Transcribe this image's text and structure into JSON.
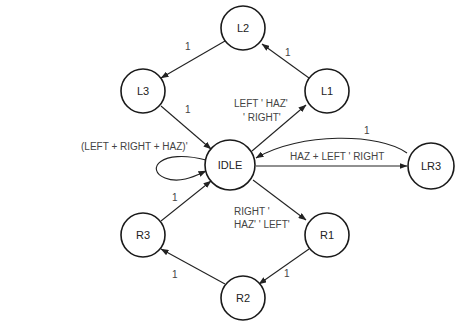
{
  "diagram": {
    "type": "state-machine",
    "nodes": [
      {
        "id": "L2",
        "label": "L2",
        "cx": 243,
        "cy": 28,
        "r": 22
      },
      {
        "id": "L3",
        "label": "L3",
        "cx": 143,
        "cy": 91,
        "r": 22
      },
      {
        "id": "L1",
        "label": "L1",
        "cx": 327,
        "cy": 91,
        "r": 22
      },
      {
        "id": "IDLE",
        "label": "IDLE",
        "cx": 230,
        "cy": 165,
        "r": 25
      },
      {
        "id": "LR3",
        "label": "LR3",
        "cx": 431,
        "cy": 166,
        "r": 23
      },
      {
        "id": "R3",
        "label": "R3",
        "cx": 143,
        "cy": 235,
        "r": 22
      },
      {
        "id": "R1",
        "label": "R1",
        "cx": 327,
        "cy": 235,
        "r": 22
      },
      {
        "id": "R2",
        "label": "R2",
        "cx": 243,
        "cy": 298,
        "r": 22
      }
    ],
    "edges": [
      {
        "from": "L2",
        "to": "L3",
        "label": "1"
      },
      {
        "from": "L3",
        "to": "IDLE",
        "label": "1"
      },
      {
        "from": "L1",
        "to": "L2",
        "label": "1"
      },
      {
        "from": "IDLE",
        "to": "L1",
        "label_line1": "LEFT ' HAZ'",
        "label_line2": "' RIGHT'"
      },
      {
        "from": "IDLE",
        "to": "IDLE",
        "label": "(LEFT + RIGHT + HAZ)'"
      },
      {
        "from": "IDLE",
        "to": "LR3",
        "label": "HAZ + LEFT ' RIGHT"
      },
      {
        "from": "LR3",
        "to": "IDLE",
        "label": "1"
      },
      {
        "from": "IDLE",
        "to": "R1",
        "label_line1": "RIGHT '",
        "label_line2": "HAZ' ' LEFT'"
      },
      {
        "from": "R1",
        "to": "R2",
        "label": "1"
      },
      {
        "from": "R2",
        "to": "R3",
        "label": "1"
      },
      {
        "from": "R3",
        "to": "IDLE",
        "label": "1"
      }
    ]
  }
}
